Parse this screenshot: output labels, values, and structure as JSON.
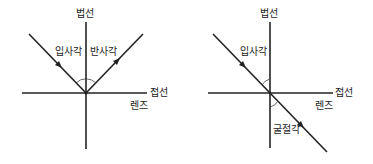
{
  "diagrams": [
    {
      "name": "reflection",
      "labels": {
        "normal": "법선",
        "incident_angle": "입사각",
        "reflected_angle": "반사각",
        "tangent": "접선",
        "lens": "렌즈"
      }
    },
    {
      "name": "refraction",
      "labels": {
        "normal": "법선",
        "incident_angle": "입사각",
        "refracted_angle": "굴절각",
        "tangent": "접선",
        "lens": "렌즈"
      }
    }
  ],
  "colors": {
    "line": "#222222",
    "arc": "#444444",
    "background": "#ffffff"
  }
}
